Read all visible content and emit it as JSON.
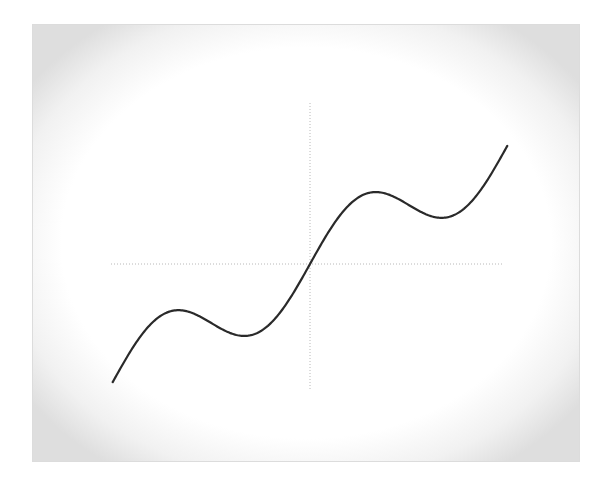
{
  "chart_data": {
    "type": "line",
    "title": "",
    "xlabel": "",
    "ylabel": "",
    "function": "y = x + 2*sin(x)",
    "xlim": [
      -6.283,
      6.283
    ],
    "ylim": [
      -6.283,
      6.283
    ],
    "grid": false,
    "axes": "dotted crosshair through origin, no tick labels",
    "series": [
      {
        "name": "curve",
        "color": "#2a2a2a",
        "x": [
          -6.283,
          -5.236,
          -4.189,
          -3.142,
          -2.094,
          -1.047,
          0,
          1.047,
          2.094,
          3.142,
          4.189,
          5.236,
          6.283
        ],
        "y": [
          -6.283,
          -3.504,
          -2.457,
          -3.142,
          -3.826,
          -2.779,
          0,
          2.779,
          3.826,
          3.142,
          2.457,
          3.504,
          6.283
        ]
      }
    ],
    "key_points": {
      "local_max": [
        [
          -4.189,
          -2.457
        ],
        [
          2.094,
          3.826
        ]
      ],
      "local_min": [
        [
          -2.094,
          -3.826
        ],
        [
          4.189,
          2.457
        ]
      ]
    }
  },
  "style": {
    "axis_color": "#b8b8b8",
    "curve_color": "#2a2a2a",
    "frame_color": "#dedede"
  }
}
